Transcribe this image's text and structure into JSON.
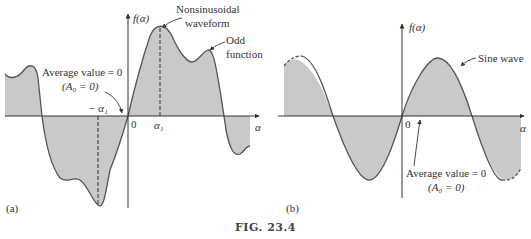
{
  "figure": {
    "caption": "FIG. 23.4",
    "panel_a": {
      "label": "(a)",
      "y_axis_label": "f(α)",
      "x_axis_label": "α",
      "origin_label": "0",
      "tick_pos_label": "α₁",
      "tick_neg_label": "− α₁",
      "annotation_waveform_line1": "Nonsinusoidal",
      "annotation_waveform_line2": "waveform",
      "annotation_odd_line1": "Odd",
      "annotation_odd_line2": "function",
      "annotation_avg_line1": "Average value = 0",
      "annotation_avg_line2": "(A₀ = 0)"
    },
    "panel_b": {
      "label": "(b)",
      "y_axis_label": "f(α)",
      "x_axis_label": "α",
      "origin_label": "0",
      "annotation_sine": "Sine wave",
      "annotation_avg_line1": "Average value = 0",
      "annotation_avg_line2": "(A₀ = 0)"
    },
    "colors": {
      "fill": "#c9c9c9",
      "curve": "#555555",
      "axis": "#333333"
    }
  }
}
